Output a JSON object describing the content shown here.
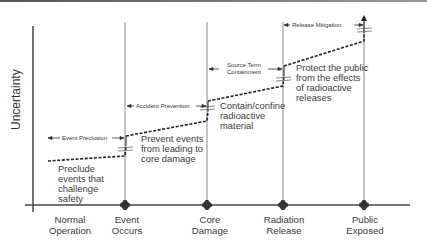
{
  "diagram": {
    "y_axis_label": "Uncertainty",
    "x_axis_labels": [
      {
        "line1": "Normal",
        "line2": "Operation"
      },
      {
        "line1": "Event",
        "line2": "Occurs"
      },
      {
        "line1": "Core",
        "line2": "Damage"
      },
      {
        "line1": "Radiation",
        "line2": "Release"
      },
      {
        "line1": "Public",
        "line2": "Exposed"
      }
    ],
    "phases": [
      {
        "label": "Event Preclusion"
      },
      {
        "label": "Accident Prevention"
      },
      {
        "label": "Source Term",
        "label2": "Containment"
      },
      {
        "label": "Release Mitigation"
      }
    ],
    "descriptions": [
      {
        "lines": [
          "Preclude",
          "events that",
          "challenge",
          "safety"
        ]
      },
      {
        "lines": [
          "Prevent events",
          "from leading to",
          "core damage"
        ]
      },
      {
        "lines": [
          "Contain/confine",
          "radioactive",
          "material"
        ]
      },
      {
        "lines": [
          "Protect the public",
          "from the effects",
          "of radioactive",
          "releases"
        ]
      }
    ],
    "colors": {
      "axis": "#444444",
      "vertical_lines": "#888888",
      "dashed_line": "#222222",
      "marker": "#333333",
      "text": "#3a3a3a"
    }
  }
}
